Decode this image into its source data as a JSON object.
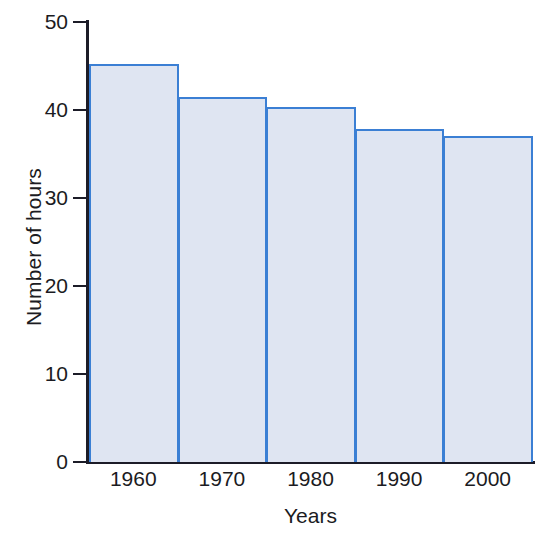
{
  "chart_data": {
    "type": "bar",
    "title": "",
    "xlabel": "Years",
    "ylabel": "Number of hours",
    "categories": [
      "1960",
      "1970",
      "1980",
      "1990",
      "2000"
    ],
    "values": [
      45.2,
      41.5,
      40.3,
      37.8,
      37.0
    ],
    "ylim": [
      0,
      50
    ],
    "y_ticks": [
      0,
      10,
      20,
      30,
      40,
      50
    ],
    "y_tick_labels": [
      "0",
      "10",
      "20",
      "30",
      "40",
      "50"
    ],
    "grid": false,
    "legend": "none",
    "bar_style": "histogram-adjacent",
    "colors": {
      "bar_fill": "#dfe5f2",
      "bar_border": "#3b7fd4",
      "axis": "#1c1c28",
      "text": "#1b1b22",
      "background": "#ffffff"
    }
  }
}
